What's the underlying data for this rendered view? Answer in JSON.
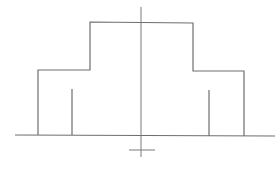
{
  "diagram": {
    "type": "stepped-profile-line-drawing",
    "stroke_color": "#6e6e6e",
    "axis_color": "#7a7a7a",
    "background": "#ffffff",
    "baseline": {
      "x1": 15,
      "y1": 135,
      "x2": 275,
      "y2": 136
    },
    "center_axis": {
      "x1": 141,
      "y1": 7,
      "x2": 141,
      "y2": 157
    },
    "center_tick": {
      "x1": 129,
      "y1": 150,
      "x2": 155,
      "y2": 150
    },
    "outline_points": "38,135 38,70 90,70 90,22 193,23 193,71 244,71 244,136",
    "inner_stubs": [
      {
        "x1": 72,
        "y1": 89,
        "x2": 72,
        "y2": 135
      },
      {
        "x1": 209,
        "y1": 90,
        "x2": 209,
        "y2": 136
      }
    ]
  },
  "caption": {
    "text": ""
  }
}
